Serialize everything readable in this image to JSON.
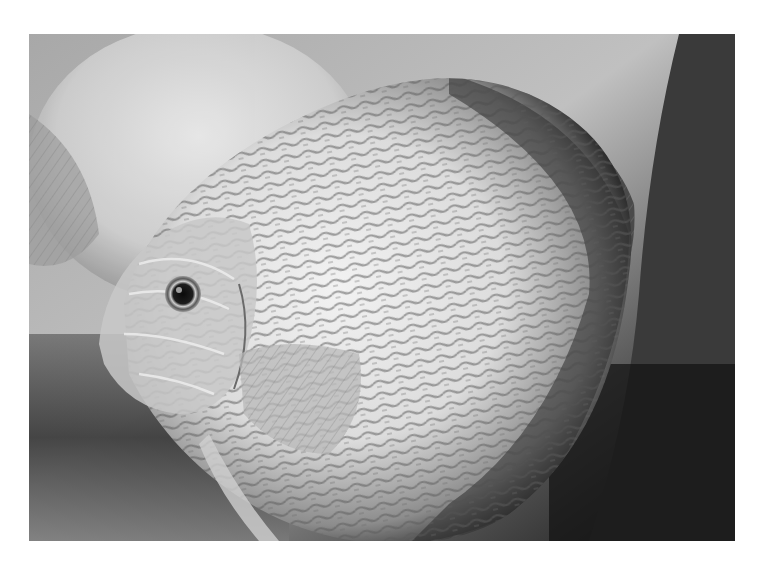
{
  "image": {
    "subject": "discus fish",
    "style": "black-and-white photograph",
    "frame": {
      "left": 29,
      "top": 34,
      "width": 706,
      "height": 507,
      "border_color": "#ffffff"
    },
    "elements": [
      {
        "name": "main-discus-fish",
        "description": "large round discus fish facing left, pale body with dark reticulated pattern"
      },
      {
        "name": "fish-eye",
        "description": "round dark eye with bright ring"
      },
      {
        "name": "pectoral-fin",
        "description": "translucent fan-shaped fin near head"
      },
      {
        "name": "background-fish",
        "description": "blurred second discus fish at upper left"
      },
      {
        "name": "dark-plant-leaf",
        "description": "dark grey leaf/plant shape at right edge"
      }
    ],
    "colors": {
      "background_light": "#b5b5b5",
      "background_dark": "#1a1a1a",
      "fish_body_light": "#e6e6e6",
      "fish_pattern_dark": "#3c3c3c"
    }
  }
}
